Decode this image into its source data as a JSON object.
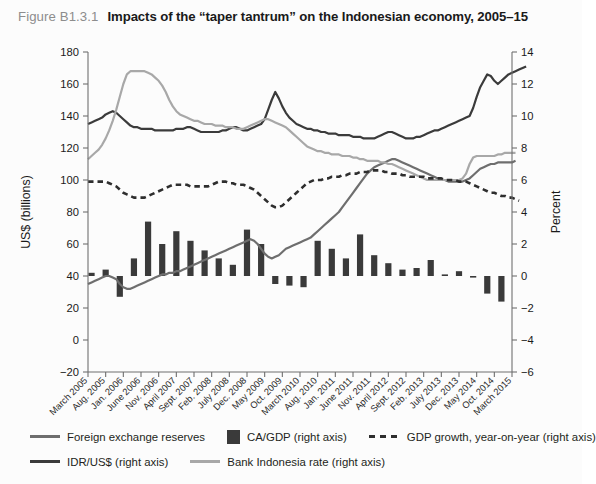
{
  "title": {
    "figure_number": "Figure B1.3.1",
    "text": "Impacts of the “taper tantrum” on the Indonesian economy, 2005–15"
  },
  "colors": {
    "idr_usd": "#3b3b3b",
    "fx_reserves": "#6e6e6e",
    "bank_indonesia_rate": "#a8a8a8",
    "ca_gdp_bar": "#3a3a3a",
    "gdp_growth": "#2e2e2e",
    "axis": "#6f6f6f",
    "background": "#fcfcfc",
    "figure_number": "#8d8d8d"
  },
  "legend": {
    "position": "bottom",
    "rows": [
      [
        {
          "label": "Foreign exchange reserves",
          "marker": "line",
          "color": "#6e6e6e",
          "name": "legend-fx-reserves"
        },
        {
          "label": "CA/GDP (right axis)",
          "marker": "box",
          "color": "#3a3a3a",
          "name": "legend-ca-gdp"
        },
        {
          "label": "GDP growth, year-on-year (right axis)",
          "marker": "dash",
          "color": "#2e2e2e",
          "name": "legend-gdp-growth"
        }
      ],
      [
        {
          "label": "IDR/US$ (right axis)",
          "marker": "line",
          "color": "#3b3b3b",
          "name": "legend-idr-usd"
        },
        {
          "label": "Bank Indonesia rate (right axis)",
          "marker": "line",
          "color": "#a8a8a8",
          "name": "legend-bi-rate"
        }
      ]
    ]
  },
  "chart_data": {
    "type": "line",
    "title": "Impacts of the “taper tantrum” on the Indonesian economy, 2005–15",
    "xlabel": "",
    "ylabel": "US$ (billions)",
    "y2label": "Percent",
    "ylim": [
      -20,
      180
    ],
    "yticks": [
      -20,
      0,
      20,
      40,
      60,
      80,
      100,
      120,
      140,
      160,
      180
    ],
    "y2lim": [
      -6,
      14
    ],
    "y2ticks": [
      -6,
      -4,
      -2,
      0,
      2,
      4,
      6,
      8,
      10,
      12,
      14
    ],
    "grid": false,
    "legend_position": "bottom",
    "xtick_labels": [
      "March 2005",
      "Aug. 2005",
      "Jan. 2006",
      "June 2006",
      "Nov. 2006",
      "April 2007",
      "Sept. 2007",
      "Feb. 2008",
      "July 2008",
      "Dec. 2008",
      "May 2009",
      "Oct. 2009",
      "March 2010",
      "Aug. 2010",
      "Jan. 2011",
      "June 2011",
      "Nov. 2011",
      "April 2012",
      "Sept. 2012",
      "Feb. 2013",
      "July 2013",
      "Dec. 2013",
      "May 2014",
      "Oct. 2014",
      "March 2015"
    ],
    "x_index_of_ticks": [
      0,
      5,
      10,
      15,
      20,
      25,
      30,
      35,
      40,
      45,
      50,
      55,
      60,
      65,
      70,
      75,
      80,
      85,
      90,
      95,
      100,
      105,
      110,
      115,
      120
    ],
    "n_points": 121,
    "series": [
      {
        "name": "Foreign exchange reserves",
        "axis": "left",
        "units": "US$ billions",
        "style": "solid",
        "color": "#6e6e6e",
        "values": [
          35,
          36,
          37,
          38,
          39,
          40,
          40,
          39,
          38,
          35,
          33,
          32,
          32,
          33,
          34,
          35,
          36,
          37,
          38,
          39,
          40,
          41,
          41,
          42,
          42,
          43,
          43,
          44,
          45,
          46,
          47,
          48,
          49,
          50,
          51,
          52,
          53,
          54,
          55,
          56,
          57,
          58,
          59,
          60,
          61,
          62,
          63,
          62,
          60,
          57,
          54,
          52,
          51,
          52,
          53,
          55,
          57,
          58,
          59,
          60,
          61,
          62,
          63,
          64,
          66,
          68,
          70,
          72,
          74,
          76,
          78,
          80,
          83,
          86,
          89,
          92,
          95,
          98,
          101,
          104,
          106,
          108,
          109,
          110,
          111,
          112,
          113,
          113,
          112,
          111,
          110,
          109,
          108,
          107,
          106,
          105,
          104,
          103,
          102,
          101,
          100,
          100,
          99,
          99,
          99,
          99,
          99,
          100,
          101,
          103,
          105,
          107,
          108,
          109,
          110,
          110,
          111,
          111,
          111,
          111,
          111,
          112
        ]
      },
      {
        "name": "IDR/US$",
        "axis": "right",
        "units": "thousands IDR per US$ (right axis scale)",
        "style": "solid",
        "color": "#3b3b3b",
        "values_left_axis": [
          135,
          136,
          137,
          138,
          139,
          141,
          142,
          143,
          142,
          140,
          138,
          136,
          134,
          133,
          133,
          132,
          132,
          132,
          132,
          131,
          131,
          131,
          131,
          131,
          131,
          132,
          132,
          132,
          133,
          133,
          132,
          131,
          130,
          130,
          130,
          130,
          130,
          130,
          131,
          131,
          132,
          133,
          133,
          132,
          131,
          131,
          132,
          133,
          134,
          135,
          138,
          144,
          150,
          155,
          151,
          146,
          142,
          139,
          137,
          135,
          134,
          133,
          132,
          132,
          131,
          131,
          130,
          130,
          129,
          129,
          129,
          128,
          128,
          128,
          128,
          127,
          127,
          127,
          126,
          126,
          126,
          126,
          127,
          128,
          129,
          130,
          130,
          129,
          128,
          127,
          126,
          126,
          126,
          127,
          127,
          128,
          129,
          130,
          131,
          131,
          132,
          133,
          134,
          135,
          136,
          137,
          138,
          139,
          140,
          145,
          152,
          158,
          162,
          166,
          165,
          162,
          160,
          162,
          164,
          166,
          167,
          168,
          169,
          170,
          171
        ]
      },
      {
        "name": "Bank Indonesia rate",
        "axis": "right",
        "units": "percent",
        "style": "solid",
        "color": "#a8a8a8",
        "values_left_axis": [
          113,
          115,
          117,
          119,
          122,
          126,
          131,
          137,
          144,
          152,
          160,
          166,
          168,
          168,
          168,
          168,
          168,
          167,
          166,
          164,
          162,
          159,
          155,
          150,
          146,
          143,
          141,
          140,
          139,
          138,
          137,
          137,
          136,
          135,
          135,
          135,
          134,
          134,
          134,
          133,
          133,
          133,
          132,
          132,
          132,
          133,
          134,
          135,
          136,
          137,
          138,
          138,
          137,
          136,
          135,
          134,
          133,
          131,
          129,
          127,
          125,
          123,
          121,
          120,
          119,
          118,
          118,
          117,
          117,
          116,
          116,
          116,
          115,
          115,
          115,
          114,
          114,
          113,
          113,
          112,
          112,
          112,
          112,
          111,
          111,
          110,
          110,
          109,
          108,
          107,
          106,
          105,
          104,
          103,
          102,
          101,
          100,
          100,
          100,
          100,
          100,
          100,
          100,
          100,
          100,
          100,
          101,
          104,
          110,
          114,
          115,
          115,
          115,
          115,
          115,
          115,
          116,
          116,
          117,
          117,
          117,
          117
        ]
      },
      {
        "name": "GDP growth, year-on-year",
        "axis": "right",
        "units": "percent",
        "style": "dashed",
        "color": "#2e2e2e",
        "values_left_axis": [
          99,
          99,
          99,
          99,
          99,
          99,
          98,
          97,
          96,
          94,
          92,
          91,
          90,
          89,
          89,
          89,
          89,
          90,
          91,
          92,
          93,
          94,
          95,
          96,
          97,
          97,
          97,
          97,
          97,
          96,
          96,
          96,
          96,
          96,
          96,
          97,
          98,
          99,
          99,
          99,
          98,
          98,
          97,
          97,
          97,
          96,
          95,
          94,
          92,
          90,
          88,
          86,
          84,
          83,
          83,
          84,
          86,
          88,
          90,
          92,
          94,
          96,
          98,
          99,
          100,
          100,
          100,
          101,
          101,
          102,
          102,
          102,
          103,
          103,
          104,
          104,
          104,
          105,
          105,
          105,
          106,
          106,
          106,
          106,
          105,
          105,
          104,
          104,
          104,
          103,
          103,
          102,
          102,
          102,
          102,
          102,
          101,
          101,
          101,
          101,
          101,
          100,
          100,
          100,
          100,
          99,
          99,
          99,
          98,
          97,
          96,
          95,
          94,
          93,
          92,
          92,
          91,
          90,
          90,
          89,
          89,
          88,
          87
        ]
      },
      {
        "name": "CA/GDP",
        "axis": "right",
        "units": "percent of GDP",
        "style": "bar",
        "color": "#3a3a3a",
        "frequency": "quarterly",
        "bar_x_index": [
          1,
          5,
          9,
          13,
          17,
          21,
          25,
          29,
          33,
          37,
          41,
          45,
          49,
          53,
          57,
          61,
          65,
          69,
          73,
          77,
          81,
          85,
          89,
          93,
          97,
          101,
          105,
          109,
          113,
          117
        ],
        "values_percent": [
          0.2,
          0.4,
          -1.3,
          1.1,
          3.4,
          2.0,
          2.8,
          2.2,
          1.6,
          1.1,
          0.7,
          2.9,
          2.0,
          -0.5,
          -0.6,
          -0.7,
          2.2,
          1.7,
          1.1,
          2.6,
          1.3,
          0.8,
          0.4,
          0.5,
          1.0,
          0.1,
          0.3,
          -0.1,
          -1.1,
          -1.6
        ],
        "values_percent_full": [
          0.2,
          0.4,
          -1.3,
          1.1,
          3.4,
          2.0,
          2.8,
          2.2,
          1.6,
          1.1,
          0.7,
          2.9,
          2.0,
          -0.5,
          -0.6,
          -0.7,
          2.2,
          1.7,
          1.1,
          2.6,
          1.3,
          0.8,
          0.4,
          0.5,
          1.0,
          0.1,
          0.3,
          -0.1,
          -1.1,
          -1.6,
          -2.6,
          -2.4,
          -3.3,
          -2.6,
          -3.2,
          -4.3,
          -3.7,
          -2.0,
          -2.1,
          -4.3,
          -2.8
        ]
      }
    ],
    "annotations": []
  }
}
